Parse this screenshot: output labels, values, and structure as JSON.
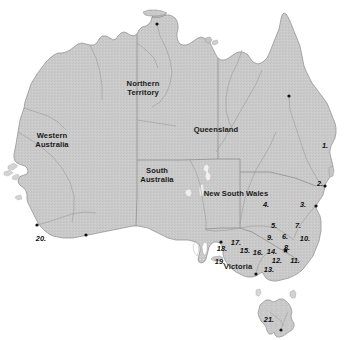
{
  "figure": {
    "kind": "reference-map",
    "region": "Australia",
    "cut_off_header_text": "distribution map of specimen localities",
    "background_color": "#ffffff",
    "land_color": "#c9c9c9",
    "land_edge_color": "#8a8a8a",
    "internal_border_color": "#8f8f8f",
    "river_color": "#9a9a9a",
    "label_color": "#161616"
  },
  "states": [
    {
      "id": "western-australia",
      "label": "Western\nAustralia",
      "line1": "Western",
      "line2": "Australia",
      "x": 52,
      "y": 141
    },
    {
      "id": "northern-territory",
      "label": "Northern\nTerritory",
      "line1": "Northern",
      "line2": "Territory",
      "x": 143,
      "y": 89
    },
    {
      "id": "queensland",
      "label": "Queensland",
      "line1": "Queensland",
      "line2": "",
      "x": 216,
      "y": 130
    },
    {
      "id": "south-australia",
      "label": "South\nAustralia",
      "line1": "South",
      "line2": "Australia",
      "x": 157,
      "y": 176
    },
    {
      "id": "new-south-wales",
      "label": "New South Wales",
      "line1": "New South Wales",
      "line2": "",
      "x": 236,
      "y": 194
    },
    {
      "id": "victoria",
      "label": "Victoria",
      "line1": "Victoria",
      "line2": "",
      "x": 238,
      "y": 267
    }
  ],
  "locality_labels": [
    {
      "id": "locality-1",
      "text": "1.",
      "x": 325,
      "y": 146
    },
    {
      "id": "locality-2",
      "text": "2.",
      "x": 320,
      "y": 184
    },
    {
      "id": "locality-3",
      "text": "3.",
      "x": 303,
      "y": 205
    },
    {
      "id": "locality-4",
      "text": "4.",
      "x": 266,
      "y": 205
    },
    {
      "id": "locality-5",
      "text": "5.",
      "x": 274,
      "y": 226
    },
    {
      "id": "locality-6",
      "text": "6.",
      "x": 285,
      "y": 237
    },
    {
      "id": "locality-7",
      "text": "7.",
      "x": 298,
      "y": 226
    },
    {
      "id": "locality-8",
      "text": "8.",
      "x": 287,
      "y": 248
    },
    {
      "id": "locality-9",
      "text": "9.",
      "x": 270,
      "y": 238
    },
    {
      "id": "locality-10",
      "text": "10.",
      "x": 305,
      "y": 239
    },
    {
      "id": "locality-11",
      "text": "11.",
      "x": 295,
      "y": 261
    },
    {
      "id": "locality-12",
      "text": "12.",
      "x": 277,
      "y": 261
    },
    {
      "id": "locality-13",
      "text": "13.",
      "x": 269,
      "y": 270
    },
    {
      "id": "locality-14",
      "text": "14.",
      "x": 272,
      "y": 252
    },
    {
      "id": "locality-15",
      "text": "15.",
      "x": 245,
      "y": 251
    },
    {
      "id": "locality-16",
      "text": "16.",
      "x": 258,
      "y": 253
    },
    {
      "id": "locality-17",
      "text": "17.",
      "x": 236,
      "y": 243
    },
    {
      "id": "locality-18",
      "text": "18.",
      "x": 222,
      "y": 249
    },
    {
      "id": "locality-19",
      "text": "19.",
      "x": 220,
      "y": 262
    },
    {
      "id": "locality-20",
      "text": "20.",
      "x": 41,
      "y": 239
    },
    {
      "id": "locality-21",
      "text": "21.",
      "x": 269,
      "y": 320
    }
  ],
  "capital_marker": {
    "id": "capital-star",
    "glyph": "★",
    "x": 285,
    "y": 251
  },
  "city_dots": [
    {
      "id": "city-dot-darwin",
      "x": 157,
      "y": 24
    },
    {
      "id": "city-dot-perth",
      "x": 37,
      "y": 225
    },
    {
      "id": "city-dot-albany",
      "x": 86,
      "y": 235
    },
    {
      "id": "city-dot-adelaide",
      "x": 221,
      "y": 242
    },
    {
      "id": "city-dot-brisbane",
      "x": 325,
      "y": 186
    },
    {
      "id": "city-dot-sydney",
      "x": 316,
      "y": 206
    },
    {
      "id": "city-dot-melbourne",
      "x": 256,
      "y": 274
    },
    {
      "id": "city-dot-townsville",
      "x": 289,
      "y": 96
    },
    {
      "id": "city-dot-hobart",
      "x": 281,
      "y": 330
    }
  ]
}
